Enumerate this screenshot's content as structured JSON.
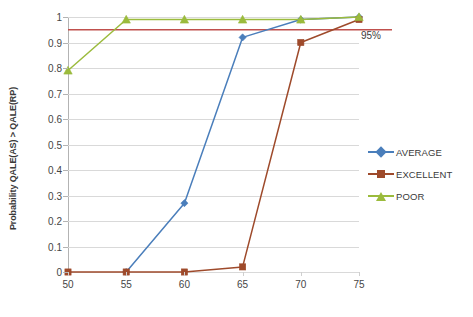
{
  "chart_data": {
    "type": "line",
    "title": "",
    "subtitle": "",
    "xlabel": "",
    "ylabel": "Probability QALE(AS) > QALE(RP)",
    "x": [
      50,
      55,
      60,
      65,
      70,
      75
    ],
    "xticklabels": [
      "50",
      "55",
      "60",
      "65",
      "70",
      "75"
    ],
    "yticklabels": [
      "0",
      "0.1",
      "0.2",
      "0.3",
      "0.4",
      "0.5",
      "0.6",
      "0.7",
      "0.8",
      "0.9",
      "1"
    ],
    "xlim": [
      50,
      75
    ],
    "ylim": [
      0,
      1
    ],
    "grid": "horizontal",
    "legend_position": "right",
    "series": [
      {
        "name": "AVERAGE",
        "color": "#4a7ebb",
        "marker": "diamond",
        "x": [
          55,
          60,
          65,
          70,
          75
        ],
        "values": [
          0.0,
          0.27,
          0.92,
          0.99,
          1.0
        ]
      },
      {
        "name": "EXCELLENT",
        "color": "#9e4a2b",
        "marker": "square",
        "x": [
          50,
          55,
          60,
          65,
          70,
          75
        ],
        "values": [
          0.0,
          0.0,
          0.0,
          0.02,
          0.9,
          0.99
        ]
      },
      {
        "name": "POOR",
        "color": "#9bbb3c",
        "marker": "triangle",
        "x": [
          50,
          55,
          60,
          65,
          70,
          75
        ],
        "values": [
          0.79,
          0.99,
          0.99,
          0.99,
          0.99,
          1.0
        ]
      }
    ],
    "annotations": [
      {
        "name": "threshold",
        "label": "95%",
        "value": 0.95,
        "color": "#c0504d",
        "orientation": "horizontal"
      }
    ]
  },
  "legend": {
    "items": [
      {
        "label": "AVERAGE"
      },
      {
        "label": "EXCELLENT"
      },
      {
        "label": "POOR"
      }
    ]
  },
  "axes": {
    "y_title": "Probability QALE(AS) > QALE(RP)"
  }
}
